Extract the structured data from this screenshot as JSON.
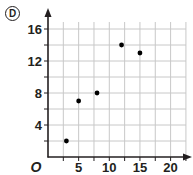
{
  "option_label": "D",
  "chart_data": {
    "type": "scatter",
    "title": "",
    "xlabel": "",
    "ylabel": "",
    "origin_label": "O",
    "xlim": [
      0,
      22.5
    ],
    "ylim": [
      0,
      18
    ],
    "grid": true,
    "x_ticks": [
      5,
      10,
      15,
      20
    ],
    "y_ticks": [
      4,
      8,
      12,
      16
    ],
    "x_tick_labels": [
      "5",
      "10",
      "15",
      "20"
    ],
    "y_tick_labels": [
      "4",
      "8",
      "12",
      "16"
    ],
    "x_grid_step": 2.5,
    "y_grid_step": 2,
    "points": [
      {
        "x": 3,
        "y": 2
      },
      {
        "x": 5,
        "y": 7
      },
      {
        "x": 8,
        "y": 8
      },
      {
        "x": 12,
        "y": 14
      },
      {
        "x": 15,
        "y": 13
      }
    ],
    "colors": {
      "axis": "#231f20",
      "grid": "#c8c8c8",
      "point": "#000000"
    }
  }
}
